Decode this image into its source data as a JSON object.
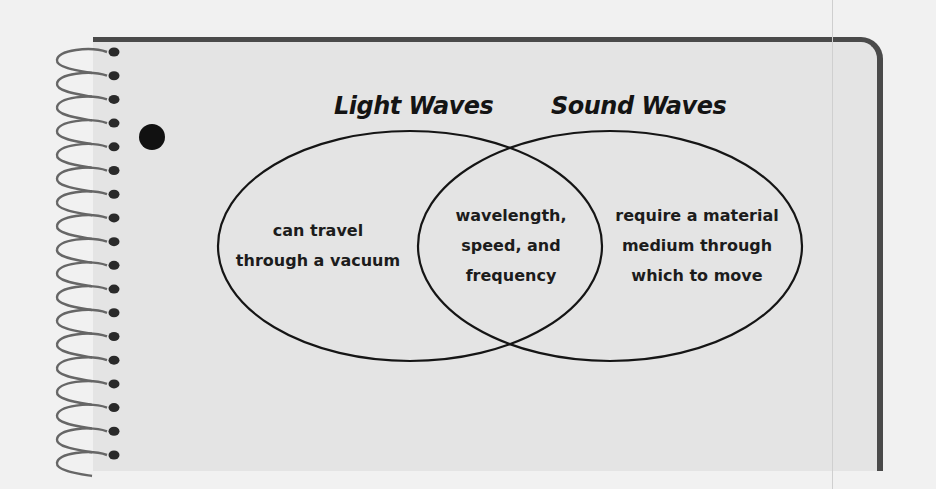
{
  "diagram": {
    "type": "venn",
    "sets": [
      {
        "id": "light",
        "title": "Light Waves",
        "unique_lines": [
          "can travel",
          "through a vacuum"
        ]
      },
      {
        "id": "sound",
        "title": "Sound Waves",
        "unique_lines": [
          "require a material",
          "medium through",
          "which to move"
        ]
      }
    ],
    "intersection_lines": [
      "wavelength,",
      "speed, and",
      "frequency"
    ]
  },
  "notebook": {
    "spiral_ring_count": 18,
    "page_color": "#e4e4e4",
    "border_color": "#4a4a4a",
    "ink_color": "#141414"
  }
}
